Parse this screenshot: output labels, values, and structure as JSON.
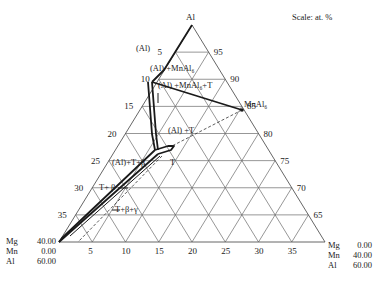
{
  "scale_label": "Scale: at. %",
  "apex_label": "Al",
  "left_corner": [
    {
      "el": "Mg",
      "val": "40.00"
    },
    {
      "el": "Mn",
      "val": "0.00"
    },
    {
      "el": "Al",
      "val": "60.00"
    }
  ],
  "right_corner": [
    {
      "el": "Mg",
      "val": "0.00"
    },
    {
      "el": "Mn",
      "val": "40.00"
    },
    {
      "el": "Al",
      "val": "60.00"
    }
  ],
  "left_axis_ticks": [
    "5",
    "10",
    "15",
    "20",
    "25",
    "30",
    "35"
  ],
  "right_axis_ticks": [
    "95",
    "90",
    "85",
    "80",
    "75",
    "70",
    "65"
  ],
  "bottom_axis_ticks": [
    "5",
    "10",
    "15",
    "20",
    "25",
    "30",
    "35"
  ],
  "phase_labels": {
    "al": "(Al)",
    "al_mnal6": "(Al) +MnAl₆",
    "al_mnal6_t": "(Al) +MnAl₆+T",
    "mnal6": "MnAl₆",
    "al_t": "(Al) +T",
    "al_t_beta": "(Al)+T+β",
    "t": "T",
    "t_beta": "T+ β",
    "t_beta_gamma": "T+β+γ"
  },
  "colors": {
    "grid": "#6a6a6a",
    "boundary": "#1a1a1a",
    "background": "#ffffff"
  }
}
